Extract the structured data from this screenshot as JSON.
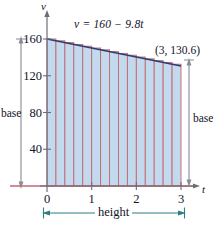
{
  "figure": {
    "axis_labels": {
      "x": "t",
      "y": "v"
    },
    "equation": "v = 160 − 9.8t",
    "point_label": "(3, 130.6)",
    "annotations": {
      "base_left": "base",
      "base_right": "base",
      "height": "height"
    },
    "colors": {
      "fill": "#c3d9ee",
      "rect_edge": "#c4666f",
      "curve": "#2c3d70",
      "axis": "#6d6d78",
      "baseline": "#c4666f",
      "annotation_arrow": "#8a8a92",
      "height_arrow": "#2f7f84",
      "text": "#12122a"
    }
  },
  "chart_data": {
    "type": "area",
    "title": "",
    "subtitle": "",
    "xlabel": "t",
    "ylabel": "v",
    "xlim": [
      0,
      3.25
    ],
    "ylim": [
      0,
      172
    ],
    "grid": false,
    "legend": null,
    "equation": "v = 160 - 9.8t",
    "xticks": [
      0,
      1,
      2,
      3
    ],
    "xtick_labels": [
      "0",
      "1",
      "2",
      "3"
    ],
    "yticks": [
      40,
      80,
      120,
      160
    ],
    "ytick_labels": [
      "40",
      "80",
      "120",
      "160"
    ],
    "series": [
      {
        "name": "v = 160 - 9.8t",
        "type": "line",
        "x": [
          0,
          3
        ],
        "values": [
          160,
          130.6
        ]
      }
    ],
    "riemann_rectangles": {
      "count": 15,
      "x_start": 0,
      "x_end": 3,
      "width": 0.2,
      "rule": "left-endpoint",
      "tops": [
        160.0,
        158.04,
        156.08,
        154.12,
        152.16,
        150.2,
        148.24,
        146.28,
        144.32,
        142.36,
        140.4,
        138.44,
        136.48,
        134.52,
        132.56
      ]
    },
    "annotations": [
      {
        "text": "(3, 130.6)",
        "x": 3,
        "y": 130.6
      },
      {
        "text": "base",
        "side": "left",
        "from": 0,
        "to": 160
      },
      {
        "text": "base",
        "side": "right",
        "from": 0,
        "to": 130.6
      },
      {
        "text": "height",
        "side": "bottom",
        "from": 0,
        "to": 3
      }
    ]
  }
}
